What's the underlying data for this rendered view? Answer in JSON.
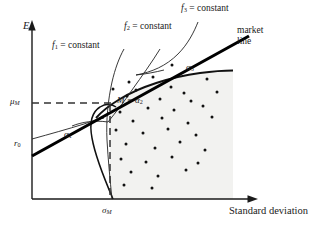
{
  "figure": {
    "title": "",
    "axes": {
      "y_label": "E",
      "x_label": "Standard deviation",
      "y_tick_labels": [
        {
          "id": "mu-M",
          "base": "μ",
          "sub": "M",
          "value_y": 103
        },
        {
          "id": "r-0",
          "base": "r",
          "sub": "0",
          "value_y": 145
        }
      ],
      "x_tick_labels": [
        {
          "id": "sigma-M",
          "base": "σ",
          "sub": "M",
          "value_x": 110
        }
      ]
    },
    "curve_labels": [
      {
        "id": "f1",
        "base": "f",
        "sub": "1",
        "rest": " = constant"
      },
      {
        "id": "f2",
        "base": "f",
        "sub": "2",
        "rest": " = constant"
      },
      {
        "id": "f3",
        "base": "f",
        "sub": "3",
        "rest": " = constant"
      }
    ],
    "market_line_label_line1": "market",
    "market_line_label_line2": "line",
    "point_labels": [
      {
        "id": "alpha1",
        "base": "α",
        "sub": "1"
      },
      {
        "id": "alpha3",
        "base": "α",
        "sub": "3"
      }
    ],
    "market_point": {
      "prefix": "M = ",
      "base": "α",
      "sub": "2"
    },
    "colors": {
      "ink": "#1a1a1a",
      "curve": "#111111",
      "market_line": "#000000",
      "feasible_fill": "#f2f2f0",
      "dash": "#333333",
      "dot": "#111111"
    }
  },
  "chart_data": {
    "type": "scatter",
    "title": "",
    "xlabel": "Standard deviation",
    "ylabel": "E",
    "grid": false,
    "legend": null,
    "axis_origin_px": {
      "x": 32,
      "y": 199
    },
    "axis_extent_px": {
      "x_end": 258,
      "y_end": 22
    },
    "annotations": [
      {
        "text": "f1 = constant",
        "x_px": 55,
        "y_px": 47
      },
      {
        "text": "f2 = constant",
        "x_px": 126,
        "y_px": 28
      },
      {
        "text": "f3 = constant",
        "x_px": 182,
        "y_px": 9
      },
      {
        "text": "market line",
        "x_px": 240,
        "y_px": 28
      },
      {
        "text": "alpha1",
        "x_px": 66,
        "y_px": 135
      },
      {
        "text": "alpha3",
        "x_px": 188,
        "y_px": 68
      },
      {
        "text": "M = alpha2",
        "x_px": 119,
        "y_px": 101
      },
      {
        "text": "mu_M",
        "x_px": 12,
        "y_px": 103
      },
      {
        "text": "r_0",
        "x_px": 16,
        "y_px": 145
      },
      {
        "text": "sigma_M",
        "x_px": 104,
        "y_px": 212
      }
    ],
    "market_line": {
      "from_px": [
        32,
        155
      ],
      "to_px": [
        249,
        37
      ],
      "intercept_label": "r_0"
    },
    "tangency_point_px": [
      110,
      104
    ],
    "efficient_frontier_label": "alpha3",
    "feasible_region_px": {
      "x0": 110,
      "y0": 72,
      "x1": 233,
      "y1": 199
    },
    "scatter_points_px": [
      [
        172,
        65
      ],
      [
        129,
        82
      ],
      [
        153,
        77
      ],
      [
        207,
        79
      ],
      [
        113,
        89
      ],
      [
        136,
        90
      ],
      [
        171,
        87
      ],
      [
        184,
        93
      ],
      [
        127,
        96
      ],
      [
        160,
        99
      ],
      [
        191,
        101
      ],
      [
        217,
        92
      ],
      [
        120,
        112
      ],
      [
        148,
        108
      ],
      [
        174,
        110
      ],
      [
        203,
        106
      ],
      [
        133,
        121
      ],
      [
        162,
        118
      ],
      [
        188,
        123
      ],
      [
        212,
        117
      ],
      [
        116,
        130
      ],
      [
        143,
        133
      ],
      [
        168,
        129
      ],
      [
        196,
        135
      ],
      [
        126,
        144
      ],
      [
        155,
        148
      ],
      [
        180,
        142
      ],
      [
        205,
        150
      ],
      [
        121,
        159
      ],
      [
        146,
        162
      ],
      [
        172,
        157
      ],
      [
        198,
        163
      ],
      [
        131,
        172
      ],
      [
        158,
        176
      ],
      [
        186,
        170
      ],
      [
        124,
        185
      ],
      [
        152,
        188
      ]
    ]
  }
}
